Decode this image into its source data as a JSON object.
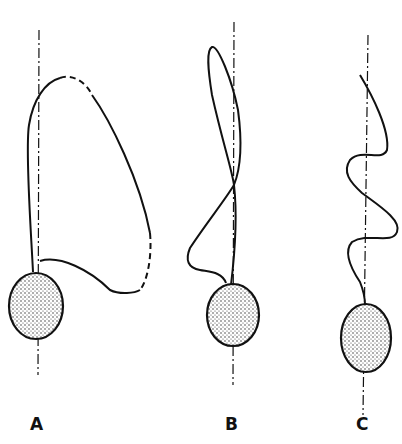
{
  "diagram": {
    "panels": [
      {
        "label": "A",
        "description": "cell with large open flagellar loop, partly dashed"
      },
      {
        "label": "B",
        "description": "cell with figure-eight twisted flagellum"
      },
      {
        "label": "C",
        "description": "cell with sinusoidal wave flagellum"
      }
    ],
    "colors": {
      "ink": "#111111",
      "background": "#ffffff"
    }
  }
}
